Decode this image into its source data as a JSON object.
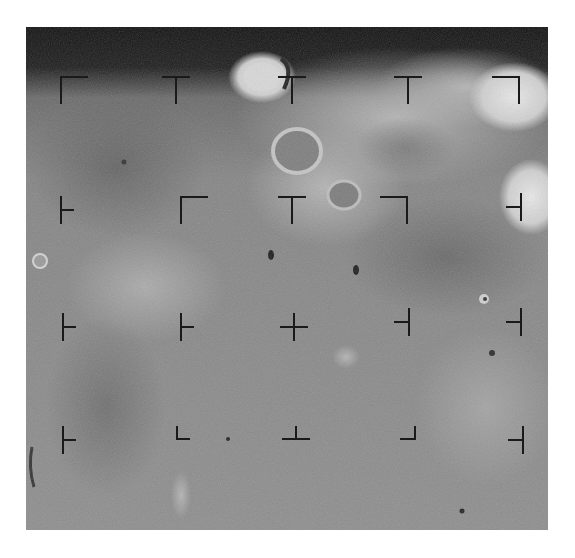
{
  "image": {
    "subject": "lunar surface photograph",
    "grayscale": true,
    "frame": {
      "x": 26,
      "y": 27,
      "width": 522,
      "height": 503
    },
    "colors": {
      "background": "#ffffff",
      "space": "#141414",
      "mare_dark": "#6e6e6e",
      "mare_mid": "#8a8a8a",
      "highland_light": "#c8c8c8",
      "crater_rim_bright": "#e6e6e6",
      "reseau_mark": "#1a1a1a"
    },
    "features": [
      {
        "type": "bright-crater",
        "cx": 236,
        "cy": 50,
        "rx": 32,
        "ry": 24
      },
      {
        "type": "large-crater",
        "cx": 271,
        "cy": 124,
        "rx": 24,
        "ry": 22
      },
      {
        "type": "crater",
        "cx": 318,
        "cy": 168,
        "rx": 16,
        "ry": 14
      },
      {
        "type": "bright-highland",
        "cx": 488,
        "cy": 70,
        "rx": 40,
        "ry": 30
      },
      {
        "type": "bright-highland",
        "cx": 505,
        "cy": 170,
        "rx": 30,
        "ry": 35
      },
      {
        "type": "small-crater",
        "cx": 14,
        "cy": 234,
        "rx": 7,
        "ry": 7
      },
      {
        "type": "dark-pit",
        "cx": 245,
        "cy": 228,
        "rx": 3,
        "ry": 5
      },
      {
        "type": "dark-pit",
        "cx": 330,
        "cy": 243,
        "rx": 3,
        "ry": 5
      },
      {
        "type": "small-crater",
        "cx": 458,
        "cy": 272,
        "rx": 5,
        "ry": 5
      },
      {
        "type": "light-patch",
        "cx": 320,
        "cy": 330,
        "rx": 14,
        "ry": 12
      },
      {
        "type": "small-crater",
        "cx": 466,
        "cy": 326,
        "rx": 4,
        "ry": 4
      },
      {
        "type": "light-streak",
        "cx": 155,
        "cy": 468,
        "rx": 10,
        "ry": 24
      }
    ]
  },
  "reseau_marks": [
    {
      "id": "r1c1",
      "x": 60,
      "y": 90,
      "shape": "corner-tl"
    },
    {
      "id": "r1c2",
      "x": 176,
      "y": 90,
      "shape": "tee-down"
    },
    {
      "id": "r1c3",
      "x": 292,
      "y": 90,
      "shape": "tee-down"
    },
    {
      "id": "r1c4",
      "x": 408,
      "y": 90,
      "shape": "tee-down"
    },
    {
      "id": "r1c5",
      "x": 520,
      "y": 90,
      "shape": "corner-tr"
    },
    {
      "id": "r2c1",
      "x": 60,
      "y": 210,
      "shape": "tee-right"
    },
    {
      "id": "r2c2",
      "x": 180,
      "y": 210,
      "shape": "corner-tl"
    },
    {
      "id": "r2c3",
      "x": 292,
      "y": 210,
      "shape": "tee-down"
    },
    {
      "id": "r2c4",
      "x": 408,
      "y": 210,
      "shape": "corner-tr"
    },
    {
      "id": "r2c5",
      "x": 520,
      "y": 207,
      "shape": "tee-left"
    },
    {
      "id": "r3c1",
      "x": 62,
      "y": 327,
      "shape": "tee-right"
    },
    {
      "id": "r3c2",
      "x": 180,
      "y": 327,
      "shape": "tee-right"
    },
    {
      "id": "r3c3",
      "x": 294,
      "y": 327,
      "shape": "cross"
    },
    {
      "id": "r3c4",
      "x": 408,
      "y": 322,
      "shape": "tee-left"
    },
    {
      "id": "r3c5",
      "x": 520,
      "y": 322,
      "shape": "tee-left"
    },
    {
      "id": "r4c1",
      "x": 62,
      "y": 440,
      "shape": "tee-right"
    },
    {
      "id": "r4c2",
      "x": 182,
      "y": 438,
      "shape": "corner-bl"
    },
    {
      "id": "r4c3",
      "x": 296,
      "y": 438,
      "shape": "tee-up"
    },
    {
      "id": "r4c4",
      "x": 408,
      "y": 438,
      "shape": "corner-br"
    },
    {
      "id": "r4c5",
      "x": 522,
      "y": 440,
      "shape": "tee-left"
    }
  ]
}
